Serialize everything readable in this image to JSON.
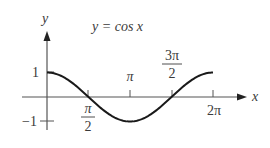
{
  "chart_data": {
    "type": "line",
    "title": "y = cos x",
    "function": "cos",
    "xlabel": "x",
    "ylabel": "y",
    "xlim": [
      0,
      6.2832
    ],
    "ylim": [
      -1,
      1
    ],
    "x_ticks": [
      {
        "value": 1.5708,
        "label_num": "π",
        "label_den": "2",
        "position": "below"
      },
      {
        "value": 3.1416,
        "label": "π",
        "position": "above"
      },
      {
        "value": 4.7124,
        "label_num": "3π",
        "label_den": "2",
        "position": "above"
      },
      {
        "value": 6.2832,
        "label": "2π",
        "position": "below"
      }
    ],
    "y_ticks": [
      {
        "value": 1,
        "label": "1"
      },
      {
        "value": -1,
        "label": "−1"
      }
    ],
    "series": [
      {
        "name": "cos x",
        "x": [
          0,
          0.7854,
          1.5708,
          2.3562,
          3.1416,
          3.927,
          4.7124,
          5.4978,
          6.2832
        ],
        "y": [
          1,
          0.707,
          0,
          -0.707,
          -1,
          -0.707,
          0,
          0.707,
          1
        ]
      }
    ],
    "grid": false,
    "legend": "none",
    "colors": {
      "curve": "#1a1a1a",
      "axis": "#555555",
      "text": "#3a3a3a"
    }
  },
  "labels": {
    "title": "y = cos x",
    "x_axis": "x",
    "y_axis": "y",
    "pi_half_num": "π",
    "pi_half_den": "2",
    "pi": "π",
    "three_pi_half_num": "3π",
    "three_pi_half_den": "2",
    "two_pi": "2π",
    "y_one": "1",
    "y_neg_one": "−1"
  }
}
